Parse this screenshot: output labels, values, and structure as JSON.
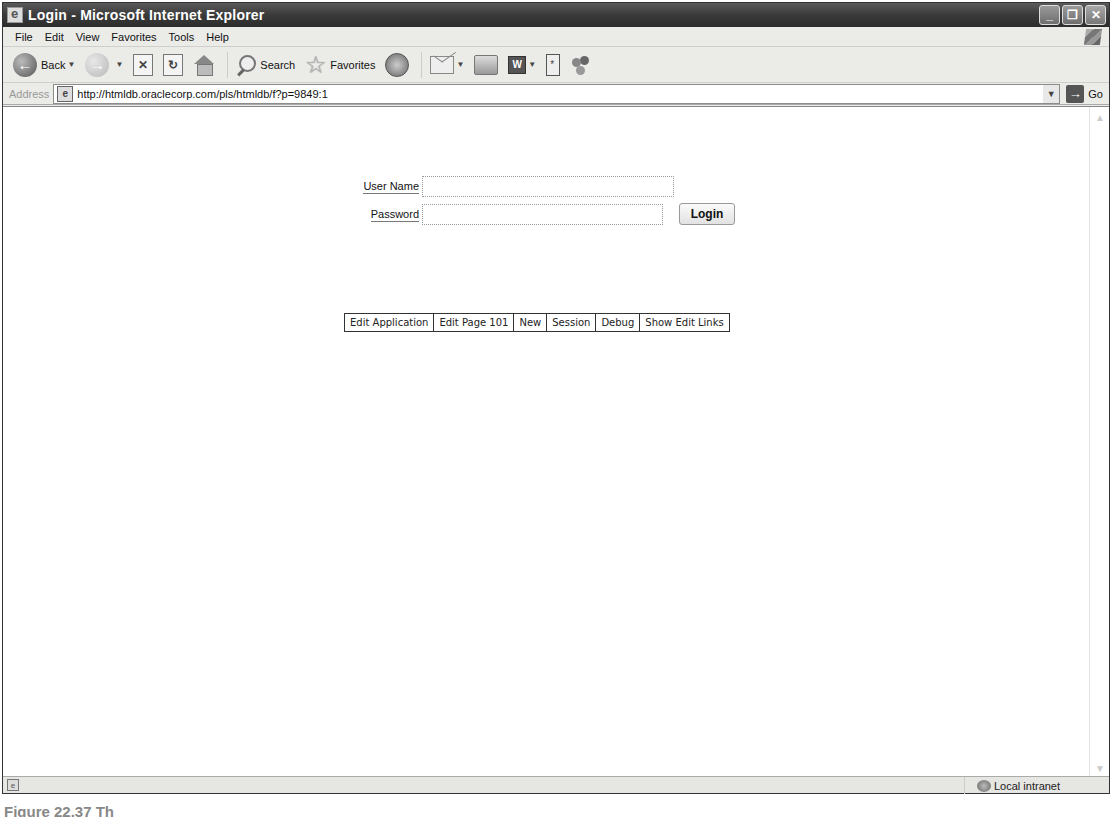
{
  "window": {
    "title": "Login - Microsoft Internet Explorer",
    "buttons": {
      "minimize": "_",
      "restore": "❐",
      "close": "✕"
    }
  },
  "menubar": {
    "items": [
      "File",
      "Edit",
      "View",
      "Favorites",
      "Tools",
      "Help"
    ]
  },
  "toolbar": {
    "back_label": "Back",
    "search_label": "Search",
    "favorites_label": "Favorites",
    "icons": [
      "back-icon",
      "forward-icon",
      "stop-icon",
      "refresh-icon",
      "home-icon",
      "search-icon",
      "favorites-star-icon",
      "history-icon",
      "mail-icon",
      "print-icon",
      "word-icon",
      "discuss-icon",
      "messenger-icon"
    ]
  },
  "addressbar": {
    "label": "Address",
    "url": "http://htmldb.oraclecorp.com/pls/htmldb/f?p=9849:1",
    "go_label": "Go"
  },
  "login": {
    "username_label": "User Name",
    "username_value": "",
    "password_label": "Password",
    "password_value": "",
    "login_button": "Login"
  },
  "dev_toolbar": {
    "links": [
      "Edit Application",
      "Edit Page 101",
      "New",
      "Session",
      "Debug",
      "Show Edit Links"
    ]
  },
  "statusbar": {
    "zone": "Local intranet"
  },
  "caption": "Figure 22.37 Th"
}
